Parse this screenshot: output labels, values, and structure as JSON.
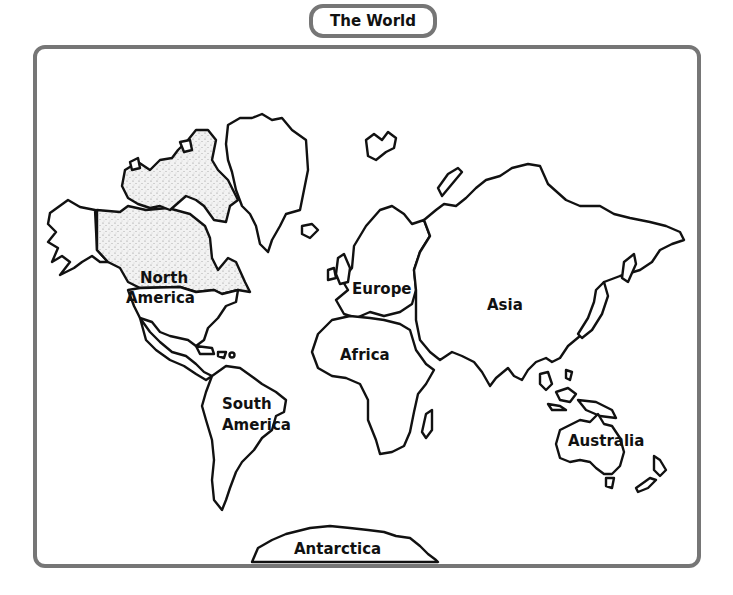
{
  "title": "The World",
  "frame_color": "#767676",
  "highlight_region": "Canada",
  "continents": [
    {
      "id": "north-america",
      "label_lines": [
        "North",
        "America"
      ]
    },
    {
      "id": "south-america",
      "label_lines": [
        "South",
        "America"
      ]
    },
    {
      "id": "europe",
      "label_lines": [
        "Europe"
      ]
    },
    {
      "id": "africa",
      "label_lines": [
        "Africa"
      ]
    },
    {
      "id": "asia",
      "label_lines": [
        "Asia"
      ]
    },
    {
      "id": "australia",
      "label_lines": [
        "Australia"
      ]
    },
    {
      "id": "antarctica",
      "label_lines": [
        "Antarctica"
      ]
    }
  ]
}
